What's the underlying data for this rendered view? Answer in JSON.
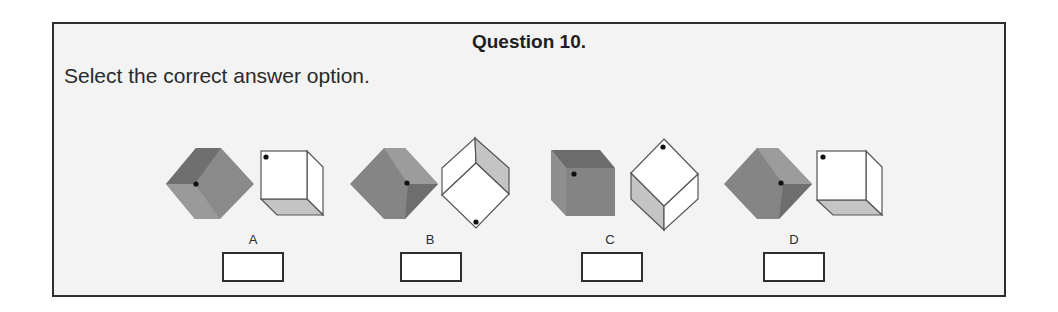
{
  "question": {
    "title": "Question 10.",
    "instruction": "Select the correct answer option."
  },
  "options": [
    {
      "label": "A"
    },
    {
      "label": "B"
    },
    {
      "label": "C"
    },
    {
      "label": "D"
    }
  ],
  "colors": {
    "frame_border": "#2e2e2e",
    "frame_background": "#f3f3f3",
    "grey_face_dark": "#737373",
    "grey_face_mid": "#8a8a8a",
    "grey_face_light": "#9e9e9e",
    "white_face": "#ffffff",
    "shaded_face": "#c4c4c4",
    "edge": "#555555"
  }
}
